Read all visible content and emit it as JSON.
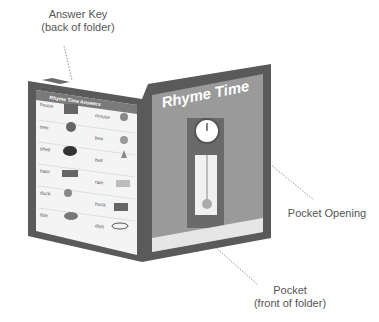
{
  "callouts": {
    "answer_key": {
      "line1": "Answer Key",
      "line2": "(back of folder)"
    },
    "pocket_opening": {
      "line1": "Pocket Opening"
    },
    "pocket": {
      "line1": "Pocket",
      "line2": "(front of folder)"
    }
  },
  "back_panel": {
    "title": "Rhyme Time Answers",
    "rows": [
      {
        "left": "house",
        "right": "mouse"
      },
      {
        "left": "tree",
        "right": "bee"
      },
      {
        "left": "shell",
        "right": "bell"
      },
      {
        "left": "train",
        "right": "rain"
      },
      {
        "left": "duck",
        "right": "truck"
      },
      {
        "left": "fish",
        "right": "dish"
      }
    ]
  },
  "front_panel": {
    "title": "Rhyme Time"
  },
  "colors": {
    "folder_frame": "#5a5a5a",
    "panel_fill": "#9a9a9a",
    "header_band": "#7a7a7a",
    "answer_bg": "#f2f2f2"
  }
}
